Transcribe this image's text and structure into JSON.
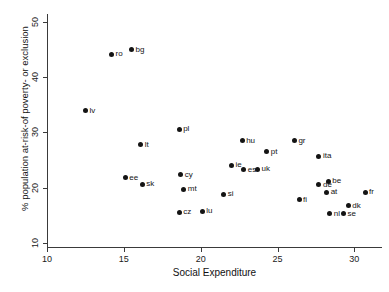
{
  "chart_data": {
    "type": "scatter",
    "title": "",
    "xlabel": "Social Expenditure",
    "ylabel": "% population at-risk-of poverty- or exclusion",
    "xlim": [
      10,
      31.8
    ],
    "ylim": [
      9.2,
      51.5
    ],
    "xticks": [
      10,
      15,
      20,
      25,
      30
    ],
    "yticks": [
      10,
      20,
      30,
      40,
      50
    ],
    "grid": false,
    "legend": "none",
    "points": [
      {
        "label": "lv",
        "x": 12.5,
        "y": 33.9
      },
      {
        "label": "ro",
        "x": 14.2,
        "y": 44.2
      },
      {
        "label": "ee",
        "x": 15.1,
        "y": 21.8
      },
      {
        "label": "bg",
        "x": 15.5,
        "y": 45.0
      },
      {
        "label": "lt",
        "x": 16.1,
        "y": 27.8
      },
      {
        "label": "sk",
        "x": 16.2,
        "y": 20.6
      },
      {
        "label": "cz",
        "x": 18.6,
        "y": 15.5
      },
      {
        "label": "cy",
        "x": 18.7,
        "y": 22.3
      },
      {
        "label": "pl",
        "x": 18.6,
        "y": 30.6
      },
      {
        "label": "mt",
        "x": 18.9,
        "y": 19.7
      },
      {
        "label": "lu",
        "x": 20.1,
        "y": 15.7
      },
      {
        "label": "si",
        "x": 21.5,
        "y": 18.8
      },
      {
        "label": "ie",
        "x": 22.0,
        "y": 24.0
      },
      {
        "label": "hu",
        "x": 22.7,
        "y": 28.5
      },
      {
        "label": "es",
        "x": 22.8,
        "y": 23.2
      },
      {
        "label": "uk",
        "x": 23.7,
        "y": 23.3
      },
      {
        "label": "pt",
        "x": 24.3,
        "y": 26.5
      },
      {
        "label": "gr",
        "x": 26.1,
        "y": 28.5
      },
      {
        "label": "fi",
        "x": 26.4,
        "y": 17.8
      },
      {
        "label": "ita",
        "x": 27.7,
        "y": 25.7
      },
      {
        "label": "de",
        "x": 27.7,
        "y": 20.5
      },
      {
        "label": "be",
        "x": 28.3,
        "y": 21.1
      },
      {
        "label": "at",
        "x": 28.2,
        "y": 19.1
      },
      {
        "label": "nl",
        "x": 28.4,
        "y": 15.2
      },
      {
        "label": "se",
        "x": 29.3,
        "y": 15.2
      },
      {
        "label": "dk",
        "x": 29.6,
        "y": 16.7
      },
      {
        "label": "fr",
        "x": 30.7,
        "y": 19.1
      }
    ],
    "colors": {
      "marker": "#141414",
      "axis": "#3a3a3a",
      "text": "#111111",
      "background": "#ffffff"
    }
  }
}
